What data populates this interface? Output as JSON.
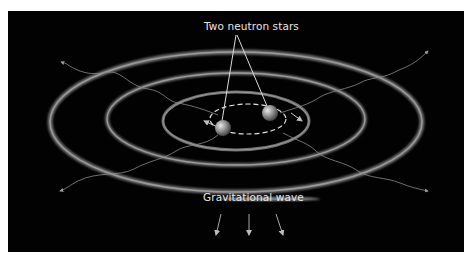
{
  "diagram": {
    "labels": {
      "neutron_stars": "Two neutron stars",
      "gravitational_wave": "Gravitational wave"
    },
    "colors": {
      "background": "#020202",
      "ring": "#8a8a8a",
      "text": "#e6e6e6",
      "line": "#dcdcdc",
      "star": "#9a9a9a"
    },
    "elements": {
      "rings": [
        "outer-ring",
        "middle-ring",
        "inner-ring"
      ],
      "stars": [
        "neutron-star-1",
        "neutron-star-2"
      ],
      "orbit": "dashed-orbit",
      "wave_arrows_count": 3,
      "radiating_wave_lines_count": 4
    }
  }
}
